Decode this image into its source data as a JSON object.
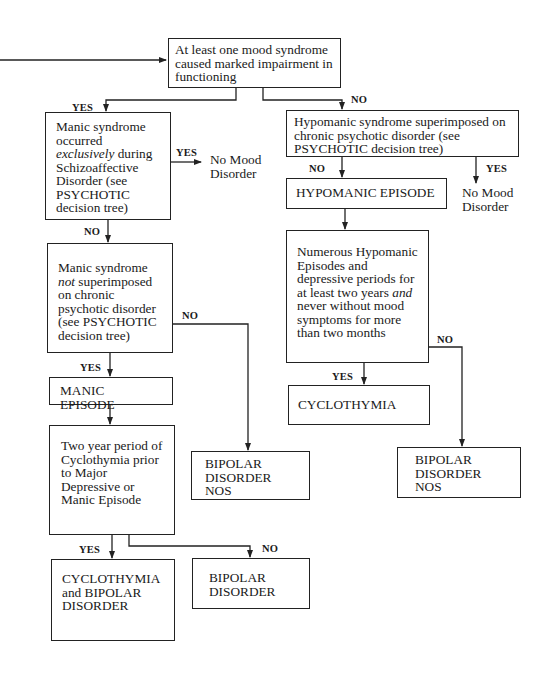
{
  "diagram": {
    "type": "decision-tree",
    "nodes": {
      "root": {
        "text": "At least one mood syndrome caused marked impairment in functioning"
      },
      "manic_exclusive": {
        "pre": "Manic syndrome occurred ",
        "em": "exclusively",
        "post": " during Schizoaffective Disorder (see PSYCHOTIC decision tree)"
      },
      "no_mood_1": {
        "text": "No Mood Disorder"
      },
      "manic_not_superimposed": {
        "pre": "Manic syndrome ",
        "em": "not",
        "post": " superimposed on chronic psychotic disorder (see PSYCHOTIC decision tree)"
      },
      "manic_episode": {
        "text": "MANIC EPISODE"
      },
      "two_year": {
        "text": "Two year period of Cyclothymia prior to Major Depressive or Manic Episode"
      },
      "bipolar_nos_left": {
        "text": "BIPOLAR DISORDER NOS"
      },
      "cyclo_and_bipolar": {
        "text": "CYCLOTHYMIA and BIPOLAR DISORDER"
      },
      "bipolar_disorder": {
        "text": "BIPOLAR DISORDER"
      },
      "hypomanic_superimposed": {
        "text": "Hypomanic syndrome superimposed on chronic psychotic disorder (see PSYCHOTIC decision tree)"
      },
      "hypomanic_episode": {
        "text": "HYPOMANIC EPISODE"
      },
      "no_mood_2": {
        "text": "No Mood Disorder"
      },
      "numerous": {
        "pre": "Numerous Hypomanic Episodes and depressive periods for at least two years ",
        "em": "and",
        "post": " never without mood symptoms for more than two months"
      },
      "cyclothymia": {
        "text": "CYCLOTHYMIA"
      },
      "bipolar_nos_right": {
        "text": "BIPOLAR DISORDER NOS"
      }
    },
    "labels": {
      "yes": "YES",
      "no": "NO"
    }
  }
}
